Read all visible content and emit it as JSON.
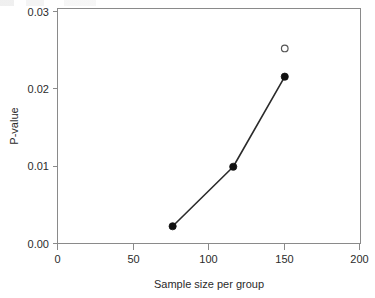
{
  "chart_data": {
    "type": "line",
    "title": "",
    "subtitle": "",
    "xlabel": "Sample size per group",
    "ylabel": "P-value",
    "xlim": [
      0,
      200
    ],
    "ylim": [
      0.0,
      0.03
    ],
    "xticks": [
      0,
      50,
      100,
      150,
      200
    ],
    "xtick_labels": [
      "0",
      "50",
      "100",
      "150",
      "200"
    ],
    "yticks": [
      0.0,
      0.01,
      0.02,
      0.03
    ],
    "ytick_labels": [
      "0.00",
      "0.01",
      "0.02",
      "0.03"
    ],
    "grid": false,
    "legend": false,
    "legend_position": "none",
    "series": [
      {
        "name": "P-value vs sample size",
        "marker": "filled-circle",
        "line": "solid",
        "color": "#111111",
        "x": [
          76,
          116,
          150
        ],
        "y": [
          0.0022,
          0.0098,
          0.0213
        ],
        "points": [
          {
            "x": 76,
            "y": 0.0022
          },
          {
            "x": 116,
            "y": 0.0098
          },
          {
            "x": 150,
            "y": 0.0213
          }
        ]
      },
      {
        "name": "Unconnected open point",
        "marker": "open-circle",
        "line": "none",
        "color": "#555555",
        "x": [
          150
        ],
        "y": [
          0.0249
        ],
        "points": [
          {
            "x": 150,
            "y": 0.0249
          }
        ]
      }
    ],
    "annotations": []
  },
  "figure": {
    "background_color": "#ffffff",
    "frame_color": "#8a8a8a",
    "text_color": "#2b2b2b"
  }
}
